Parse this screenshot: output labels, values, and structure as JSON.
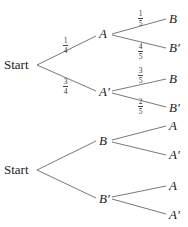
{
  "trees": [
    {
      "root": "Start",
      "level1": [
        {
          "label": "A",
          "prob_num": "1",
          "prob_den": "4"
        },
        {
          "label": "A′",
          "prob_num": "3",
          "prob_den": "4"
        }
      ],
      "level2": [
        {
          "parent": "A",
          "label": "B",
          "prob_num": "1",
          "prob_den": "5"
        },
        {
          "parent": "A",
          "label": "B′",
          "prob_num": "4",
          "prob_den": "5"
        },
        {
          "parent": "A′",
          "label": "B",
          "prob_num": "3",
          "prob_den": "5"
        },
        {
          "parent": "A′",
          "label": "B′",
          "prob_num": "2",
          "prob_den": "5"
        }
      ]
    },
    {
      "root": "Start",
      "level1": [
        {
          "label": "B"
        },
        {
          "label": "B′"
        }
      ],
      "level2": [
        {
          "parent": "B",
          "label": "A"
        },
        {
          "parent": "B",
          "label": "A′"
        },
        {
          "parent": "B′",
          "label": "A"
        },
        {
          "parent": "B′",
          "label": "A′"
        }
      ]
    }
  ]
}
